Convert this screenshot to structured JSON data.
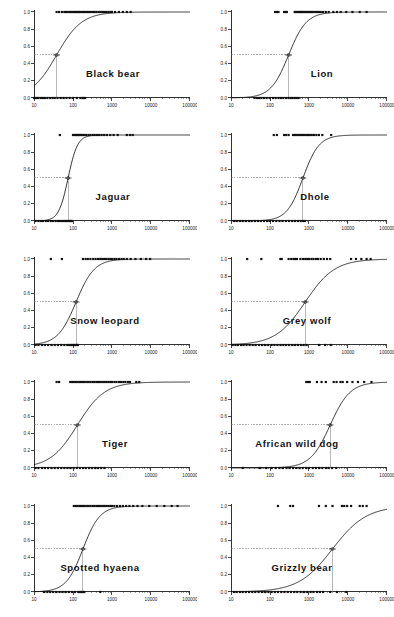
{
  "figure": {
    "background": "#ffffff",
    "axis_color": "#1a1a1a",
    "curve_color": "#111111",
    "point_color": "#111111",
    "guide_color": "#777777",
    "rows": 5,
    "cols": 2,
    "caption_fragment": ""
  },
  "axes": {
    "x_tick_labels": [
      "10",
      "100",
      "1000",
      "10000",
      "100000"
    ],
    "x_tick_values": [
      10,
      100,
      1000,
      10000,
      100000
    ],
    "y_tick_labels": [
      "0.0",
      "0.2",
      "0.4",
      "0.6",
      "0.8",
      "1.0"
    ],
    "y_tick_values": [
      0.0,
      0.2,
      0.4,
      0.6,
      0.8,
      1.0
    ],
    "xlim": [
      10,
      100000
    ],
    "ylim": [
      0,
      1
    ],
    "xscale": "log",
    "xlabel": "",
    "ylabel": "",
    "grid": false
  },
  "chart_data": {
    "type": "line",
    "title": "",
    "xlabel": "",
    "ylabel": "",
    "xscale": "log",
    "xlim": [
      10,
      100000
    ],
    "ylim": [
      0,
      1
    ],
    "grid": false,
    "legend": "none",
    "panels": [
      {
        "name": "black-bear",
        "label": "Black bear",
        "label_x": 113,
        "label_y": 68,
        "ed50": 38,
        "slope": 1.35,
        "points_one": [
          38,
          44,
          52,
          60,
          66,
          72,
          80,
          86,
          95,
          105,
          112,
          120,
          130,
          140,
          150,
          165,
          180,
          195,
          210,
          230,
          250,
          270,
          300,
          330,
          360,
          400,
          450,
          500,
          560,
          620,
          700,
          800,
          900,
          1000,
          1200,
          1500,
          1900,
          2400,
          3000
        ],
        "points_zero": [
          10,
          11,
          12,
          13,
          15,
          17,
          19,
          22,
          26,
          30,
          34,
          40,
          48,
          57,
          68,
          82,
          100,
          125,
          155,
          175,
          190,
          205
        ]
      },
      {
        "name": "lion",
        "label": "Lion",
        "label_x": 125,
        "label_y": 68,
        "ed50": 300,
        "slope": 1.9,
        "points_one": [
          135,
          150,
          165,
          230,
          255,
          270,
          430,
          460,
          500,
          540,
          580,
          620,
          660,
          700,
          760,
          820,
          880,
          950,
          1020,
          1100,
          1200,
          1300,
          1450,
          1600,
          1800,
          2000,
          2300,
          2700,
          3200,
          4200,
          5200,
          6500,
          9000,
          13000,
          20000,
          30000
        ],
        "points_zero": [
          40,
          46,
          52,
          60,
          70,
          82,
          100,
          120,
          140,
          165,
          190,
          220,
          260,
          300,
          340,
          380,
          430,
          480,
          540
        ]
      },
      {
        "name": "jaguar",
        "label": "Jaguar",
        "label_x": 113,
        "label_y": 68,
        "ed50": 75,
        "slope": 3.6,
        "points_one": [
          46,
          100,
          110,
          118,
          126,
          135,
          145,
          155,
          168,
          185,
          200,
          220,
          250,
          280,
          320,
          360,
          410,
          470,
          540,
          630,
          740,
          900,
          1100,
          1400,
          2400,
          2900,
          3400
        ],
        "points_zero": [
          11,
          13,
          15,
          17,
          20,
          23,
          27,
          31,
          36,
          41,
          46,
          52,
          58,
          64,
          70,
          76,
          82,
          88,
          94
        ]
      },
      {
        "name": "dhole",
        "label": "Dhole",
        "label_x": 118,
        "label_y": 68,
        "ed50": 700,
        "slope": 2.1,
        "points_one": [
          125,
          150,
          230,
          260,
          300,
          390,
          440,
          480,
          530,
          580,
          640,
          700,
          780,
          860,
          950,
          1050,
          1180,
          1350,
          1550,
          1800,
          2200,
          3700
        ],
        "points_zero": [
          12,
          14,
          17,
          20,
          24,
          29,
          34,
          41,
          49,
          58,
          70,
          84,
          100,
          120,
          145,
          175,
          210,
          255,
          305,
          365,
          440,
          520,
          610,
          700,
          780
        ]
      },
      {
        "name": "snow-leopard",
        "label": "Snow leopard",
        "label_x": 105,
        "label_y": 68,
        "ed50": 120,
        "slope": 1.85,
        "points_one": [
          27,
          52,
          180,
          210,
          240,
          280,
          330,
          380,
          440,
          500,
          560,
          630,
          700,
          800,
          900,
          1000,
          1150,
          1300,
          1500,
          1750,
          2000,
          2400,
          3000,
          4000,
          5500,
          7500,
          9500
        ],
        "points_zero": [
          11,
          13,
          16,
          19,
          23,
          28,
          34,
          41,
          50,
          60,
          72,
          80,
          88,
          95,
          103,
          110,
          118,
          126,
          134
        ]
      },
      {
        "name": "grey-wolf",
        "label": "Grey wolf",
        "label_x": 110,
        "label_y": 68,
        "ed50": 800,
        "slope": 1.15,
        "points_one": [
          26,
          60,
          185,
          200,
          300,
          350,
          400,
          440,
          490,
          600,
          700,
          800,
          900,
          1000,
          1150,
          1300,
          1500,
          1700,
          2000,
          2400,
          2900,
          3500,
          12000,
          16000,
          22000,
          30000,
          38000
        ],
        "points_zero": [
          11,
          13,
          15,
          18,
          21,
          25,
          30,
          36,
          43,
          52,
          62,
          75,
          90,
          110,
          130,
          155,
          185,
          220,
          260,
          310,
          370,
          440,
          520,
          620,
          730,
          860,
          1800,
          2600,
          3600
        ]
      },
      {
        "name": "tiger",
        "label": "Tiger",
        "label_x": 115,
        "label_y": 68,
        "ed50": 130,
        "slope": 1.25,
        "points_one": [
          38,
          44,
          85,
          95,
          105,
          118,
          130,
          145,
          160,
          180,
          200,
          225,
          250,
          280,
          315,
          350,
          395,
          440,
          495,
          560,
          630,
          710,
          800,
          900,
          1000,
          1150,
          1300,
          1500,
          1700,
          1950,
          2200,
          2550,
          2900,
          4200,
          5000
        ],
        "points_zero": [
          11,
          13,
          16,
          19,
          23,
          28,
          34,
          41,
          50,
          60,
          72,
          86,
          104,
          125,
          150,
          180,
          215,
          260,
          310,
          370,
          440,
          530,
          640
        ]
      },
      {
        "name": "african-wild-dog",
        "label": "African wild dog",
        "label_x": 100,
        "label_y": 68,
        "ed50": 3500,
        "slope": 1.7,
        "points_one": [
          850,
          950,
          1050,
          1600,
          2100,
          2700,
          4300,
          5100,
          6400,
          7300,
          9500,
          13000,
          18000,
          26000,
          40000
        ],
        "points_zero": [
          20,
          55,
          80,
          110,
          140,
          175,
          215,
          265,
          320,
          390,
          470,
          570,
          690,
          840,
          1000,
          1250,
          1500,
          1800,
          2200,
          2700,
          3200,
          3900,
          5000
        ]
      },
      {
        "name": "spotted-hyaena",
        "label": "Spotted hyaena",
        "label_x": 100,
        "label_y": 68,
        "ed50": 180,
        "slope": 2.0,
        "points_one": [
          105,
          118,
          130,
          145,
          160,
          180,
          200,
          225,
          250,
          280,
          315,
          350,
          395,
          440,
          495,
          560,
          630,
          710,
          800,
          900,
          1000,
          1150,
          1350,
          1600,
          1900,
          2300,
          2800,
          3500,
          4500,
          6000,
          9000,
          14000,
          22000,
          34000,
          48000
        ],
        "points_zero": [
          18,
          22,
          26,
          31,
          37,
          45,
          54,
          65,
          78,
          94,
          113,
          136,
          150,
          165,
          180,
          195,
          500
        ]
      },
      {
        "name": "grizzly-bear",
        "label": "Grizzly bear",
        "label_x": 105,
        "label_y": 68,
        "ed50": 4000,
        "slope": 1.0,
        "points_one": [
          160,
          330,
          390,
          1800,
          2700,
          4000,
          7000,
          8000,
          9500,
          12000,
          20000,
          24000,
          30000
        ],
        "points_zero": [
          12,
          14,
          17,
          20,
          24,
          29,
          35,
          42,
          51,
          62,
          75,
          91,
          110,
          133,
          160,
          195,
          235,
          285,
          345,
          420,
          500,
          610,
          740,
          900,
          1100,
          1300,
          1600,
          1900,
          2300,
          3500,
          5200,
          9000
        ]
      }
    ]
  }
}
